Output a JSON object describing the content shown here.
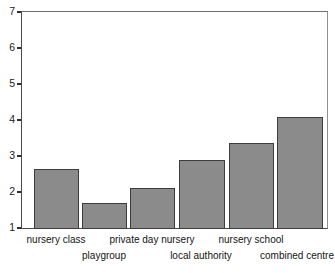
{
  "chart_data": {
    "type": "bar",
    "title": "",
    "subtitle": "",
    "xlabel": "",
    "ylabel": "",
    "categories": [
      "nursery class",
      "playgroup",
      "private day nursery",
      "local authority",
      "nursery school",
      "combined centre"
    ],
    "values": [
      2.65,
      1.72,
      2.12,
      2.9,
      3.37,
      4.1
    ],
    "series": [
      {
        "name": "score",
        "values": [
          2.65,
          1.72,
          2.12,
          2.9,
          3.37,
          4.1
        ]
      }
    ],
    "ylim": [
      1,
      7
    ],
    "yticks": [
      1,
      2,
      3,
      4,
      5,
      6,
      7
    ],
    "ytick_labels": [
      "1",
      "2",
      "3",
      "4",
      "5",
      "6",
      "7"
    ],
    "grid": false,
    "legend": false,
    "legend_position": "none",
    "bar_fill_color": "#8b8b8b",
    "bar_edge_color": "#3d3d3d",
    "axis_color": "#4a4a4a",
    "background_color": "#ffffff"
  },
  "axis": {
    "y_ticks": [
      {
        "label": "7",
        "value": 7
      },
      {
        "label": "6",
        "value": 6
      },
      {
        "label": "5",
        "value": 5
      },
      {
        "label": "4",
        "value": 4
      },
      {
        "label": "3",
        "value": 3
      },
      {
        "label": "2",
        "value": 2
      },
      {
        "label": "1",
        "value": 1
      }
    ]
  },
  "x_labels": [
    {
      "text": "nursery class",
      "row": 0
    },
    {
      "text": "playgroup",
      "row": 1
    },
    {
      "text": "private day nursery",
      "row": 0
    },
    {
      "text": "local authority",
      "row": 1
    },
    {
      "text": "nursery school",
      "row": 0
    },
    {
      "text": "combined centre",
      "row": 1
    }
  ]
}
